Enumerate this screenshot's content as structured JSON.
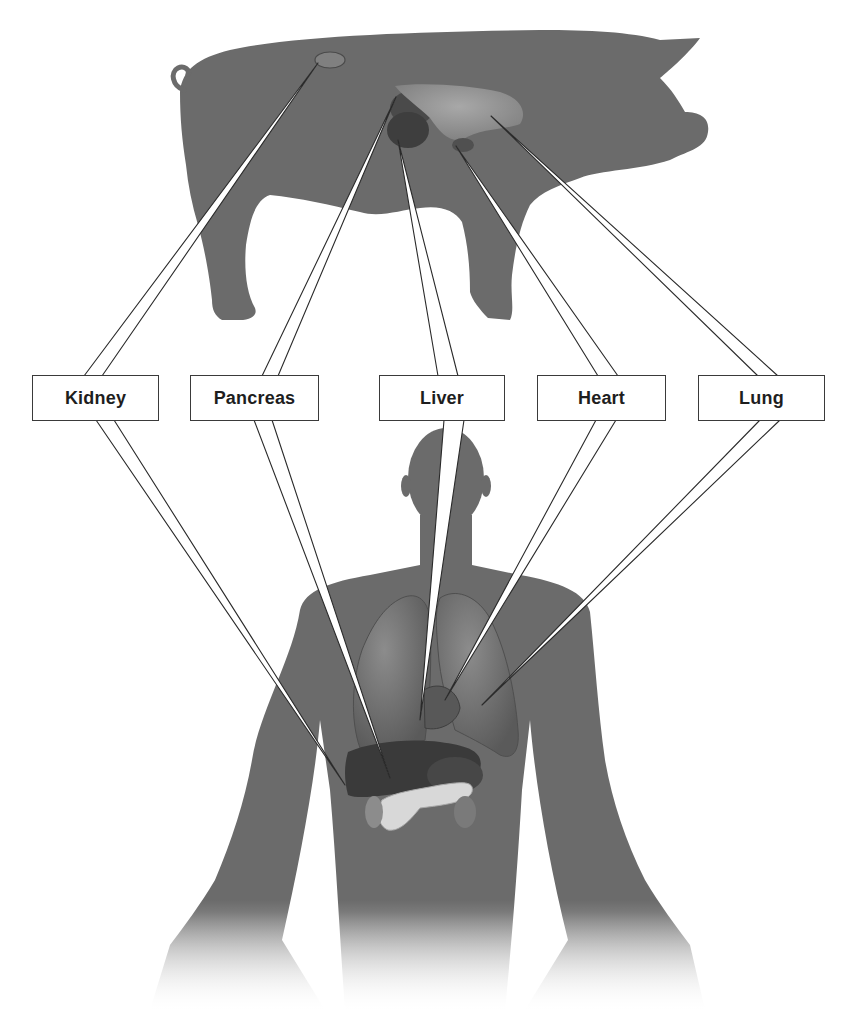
{
  "diagram": {
    "colors": {
      "background": "#ffffff",
      "silhouette": "#6b6b6b",
      "leader_fill": "#ffffff",
      "leader_stroke": "#2a2a2a",
      "box_border": "#3a3a3a",
      "label_text": "#1e1e1e"
    },
    "figures": {
      "donor": "pig-silhouette",
      "recipient": "human-silhouette"
    },
    "labels": [
      {
        "id": "kidney",
        "text": "Kidney",
        "left": 32,
        "width": 127
      },
      {
        "id": "pancreas",
        "text": "Pancreas",
        "left": 190,
        "width": 129
      },
      {
        "id": "liver",
        "text": "Liver",
        "left": 379,
        "width": 126
      },
      {
        "id": "heart",
        "text": "Heart",
        "left": 537,
        "width": 129
      },
      {
        "id": "lung",
        "text": "Lung",
        "left": 698,
        "width": 127
      }
    ]
  }
}
